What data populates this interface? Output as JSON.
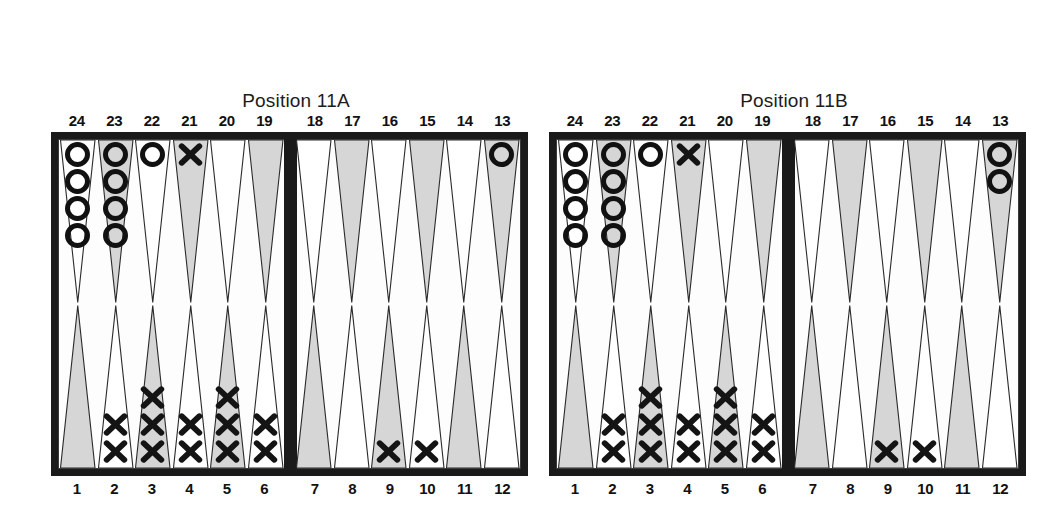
{
  "page": {
    "background_color": "#ffffff",
    "ink_color": "#1a1a1a",
    "point_shade_color": "#d6d6d6"
  },
  "boards": [
    {
      "id": "board-a",
      "title_line1": "Position 11A",
      "title_line2": "X to Play 2",
      "numbers_top": [
        "24",
        "23",
        "22",
        "21",
        "20",
        "19",
        "18",
        "17",
        "16",
        "15",
        "14",
        "13"
      ],
      "numbers_bottom": [
        "1",
        "2",
        "3",
        "4",
        "5",
        "6",
        "7",
        "8",
        "9",
        "10",
        "11",
        "12"
      ],
      "points": [
        {
          "number": "24",
          "row": "top",
          "shaded": false,
          "checker": "O",
          "count": 4
        },
        {
          "number": "23",
          "row": "top",
          "shaded": true,
          "checker": "O",
          "count": 4
        },
        {
          "number": "22",
          "row": "top",
          "shaded": false,
          "checker": "O",
          "count": 1
        },
        {
          "number": "21",
          "row": "top",
          "shaded": true,
          "checker": "X",
          "count": 1
        },
        {
          "number": "20",
          "row": "top",
          "shaded": false,
          "checker": "",
          "count": 0
        },
        {
          "number": "19",
          "row": "top",
          "shaded": true,
          "checker": "",
          "count": 0
        },
        {
          "number": "18",
          "row": "top",
          "shaded": false,
          "checker": "",
          "count": 0
        },
        {
          "number": "17",
          "row": "top",
          "shaded": true,
          "checker": "",
          "count": 0
        },
        {
          "number": "16",
          "row": "top",
          "shaded": false,
          "checker": "",
          "count": 0
        },
        {
          "number": "15",
          "row": "top",
          "shaded": true,
          "checker": "",
          "count": 0
        },
        {
          "number": "14",
          "row": "top",
          "shaded": false,
          "checker": "",
          "count": 0
        },
        {
          "number": "13",
          "row": "top",
          "shaded": true,
          "checker": "O",
          "count": 1
        },
        {
          "number": "1",
          "row": "bottom",
          "shaded": true,
          "checker": "",
          "count": 0
        },
        {
          "number": "2",
          "row": "bottom",
          "shaded": false,
          "checker": "X",
          "count": 2
        },
        {
          "number": "3",
          "row": "bottom",
          "shaded": true,
          "checker": "X",
          "count": 3
        },
        {
          "number": "4",
          "row": "bottom",
          "shaded": false,
          "checker": "X",
          "count": 2
        },
        {
          "number": "5",
          "row": "bottom",
          "shaded": true,
          "checker": "X",
          "count": 3
        },
        {
          "number": "6",
          "row": "bottom",
          "shaded": false,
          "checker": "X",
          "count": 2
        },
        {
          "number": "7",
          "row": "bottom",
          "shaded": true,
          "checker": "",
          "count": 0
        },
        {
          "number": "8",
          "row": "bottom",
          "shaded": false,
          "checker": "",
          "count": 0
        },
        {
          "number": "9",
          "row": "bottom",
          "shaded": true,
          "checker": "X",
          "count": 1
        },
        {
          "number": "10",
          "row": "bottom",
          "shaded": false,
          "checker": "X",
          "count": 1
        },
        {
          "number": "11",
          "row": "bottom",
          "shaded": true,
          "checker": "",
          "count": 0
        },
        {
          "number": "12",
          "row": "bottom",
          "shaded": false,
          "checker": "",
          "count": 0
        }
      ]
    },
    {
      "id": "board-b",
      "title_line1": "Position 11B",
      "title_line2": "X to Play 2–1",
      "numbers_top": [
        "24",
        "23",
        "22",
        "21",
        "20",
        "19",
        "18",
        "17",
        "16",
        "15",
        "14",
        "13"
      ],
      "numbers_bottom": [
        "1",
        "2",
        "3",
        "4",
        "5",
        "6",
        "7",
        "8",
        "9",
        "10",
        "11",
        "12"
      ],
      "points": [
        {
          "number": "24",
          "row": "top",
          "shaded": false,
          "checker": "O",
          "count": 4
        },
        {
          "number": "23",
          "row": "top",
          "shaded": true,
          "checker": "O",
          "count": 4
        },
        {
          "number": "22",
          "row": "top",
          "shaded": false,
          "checker": "O",
          "count": 1
        },
        {
          "number": "21",
          "row": "top",
          "shaded": true,
          "checker": "X",
          "count": 1
        },
        {
          "number": "20",
          "row": "top",
          "shaded": false,
          "checker": "",
          "count": 0
        },
        {
          "number": "19",
          "row": "top",
          "shaded": true,
          "checker": "",
          "count": 0
        },
        {
          "number": "18",
          "row": "top",
          "shaded": false,
          "checker": "",
          "count": 0
        },
        {
          "number": "17",
          "row": "top",
          "shaded": true,
          "checker": "",
          "count": 0
        },
        {
          "number": "16",
          "row": "top",
          "shaded": false,
          "checker": "",
          "count": 0
        },
        {
          "number": "15",
          "row": "top",
          "shaded": true,
          "checker": "",
          "count": 0
        },
        {
          "number": "14",
          "row": "top",
          "shaded": false,
          "checker": "",
          "count": 0
        },
        {
          "number": "13",
          "row": "top",
          "shaded": true,
          "checker": "O",
          "count": 2
        },
        {
          "number": "1",
          "row": "bottom",
          "shaded": true,
          "checker": "",
          "count": 0
        },
        {
          "number": "2",
          "row": "bottom",
          "shaded": false,
          "checker": "X",
          "count": 2
        },
        {
          "number": "3",
          "row": "bottom",
          "shaded": true,
          "checker": "X",
          "count": 3
        },
        {
          "number": "4",
          "row": "bottom",
          "shaded": false,
          "checker": "X",
          "count": 2
        },
        {
          "number": "5",
          "row": "bottom",
          "shaded": true,
          "checker": "X",
          "count": 3
        },
        {
          "number": "6",
          "row": "bottom",
          "shaded": false,
          "checker": "X",
          "count": 2
        },
        {
          "number": "7",
          "row": "bottom",
          "shaded": true,
          "checker": "",
          "count": 0
        },
        {
          "number": "8",
          "row": "bottom",
          "shaded": false,
          "checker": "",
          "count": 0
        },
        {
          "number": "9",
          "row": "bottom",
          "shaded": true,
          "checker": "X",
          "count": 1
        },
        {
          "number": "10",
          "row": "bottom",
          "shaded": false,
          "checker": "X",
          "count": 1
        },
        {
          "number": "11",
          "row": "bottom",
          "shaded": true,
          "checker": "",
          "count": 0
        },
        {
          "number": "12",
          "row": "bottom",
          "shaded": false,
          "checker": "",
          "count": 0
        }
      ]
    }
  ]
}
